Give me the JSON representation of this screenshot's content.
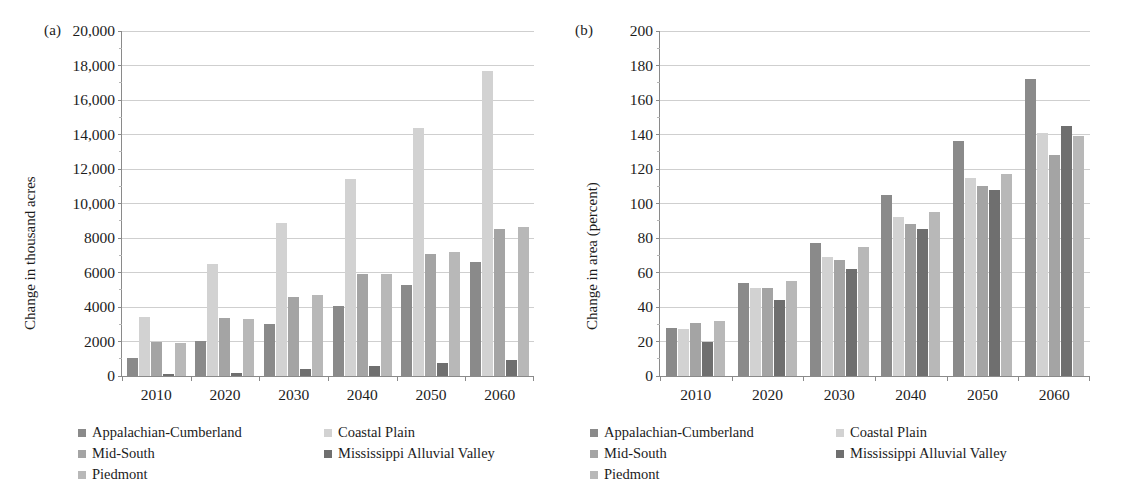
{
  "figure": {
    "panels": [
      {
        "tag": "(a)",
        "ylabel": "Change in thousand acres",
        "chart_data": {
          "type": "bar",
          "title": "",
          "xlabel": "",
          "ylabel": "Change in thousand acres",
          "categories": [
            "2010",
            "2020",
            "2030",
            "2040",
            "2050",
            "2060"
          ],
          "ylim": [
            0,
            20000
          ],
          "ytick_step": 2000,
          "yticks": [
            0,
            2000,
            4000,
            6000,
            8000,
            10000,
            12000,
            14000,
            16000,
            18000,
            20000
          ],
          "ytick_labels": [
            "0",
            "2000",
            "4000",
            "6000",
            "8000",
            "10,000",
            "12,000",
            "14,000",
            "16,000",
            "18,000",
            "20,000"
          ],
          "grid": true,
          "legend_position": "below",
          "series": [
            {
              "name": "Appalachian-Cumberland",
              "color": "#8a8a8a",
              "values": [
                1050,
                2050,
                3000,
                4050,
                5300,
                6600
              ]
            },
            {
              "name": "Coastal Plain",
              "color": "#d2d2d2",
              "values": [
                3450,
                6500,
                8850,
                11450,
                14400,
                17700
              ]
            },
            {
              "name": "Mid-South",
              "color": "#a4a4a4",
              "values": [
                2000,
                3350,
                4600,
                5900,
                7100,
                8500
              ]
            },
            {
              "name": "Mississippi Alluvial Valley",
              "color": "#6f6f6f",
              "values": [
                100,
                200,
                400,
                600,
                750,
                950
              ]
            },
            {
              "name": "Piedmont",
              "color": "#b8b8b8",
              "values": [
                1900,
                3300,
                4700,
                5900,
                7200,
                8650
              ]
            }
          ]
        }
      },
      {
        "tag": "(b)",
        "ylabel": "Change in area (percent)",
        "chart_data": {
          "type": "bar",
          "title": "",
          "xlabel": "",
          "ylabel": "Change in area (percent)",
          "categories": [
            "2010",
            "2020",
            "2030",
            "2040",
            "2050",
            "2060"
          ],
          "ylim": [
            0,
            200
          ],
          "ytick_step": 20,
          "yticks": [
            0,
            20,
            40,
            60,
            80,
            100,
            120,
            140,
            160,
            180,
            200
          ],
          "ytick_labels": [
            "0",
            "20",
            "40",
            "60",
            "80",
            "100",
            "120",
            "140",
            "160",
            "180",
            "200"
          ],
          "grid": true,
          "legend_position": "below",
          "series": [
            {
              "name": "Appalachian-Cumberland",
              "color": "#8a8a8a",
              "values": [
                28,
                54,
                77,
                105,
                136,
                172
              ]
            },
            {
              "name": "Coastal Plain",
              "color": "#d2d2d2",
              "values": [
                27,
                51,
                69,
                92,
                115,
                141
              ]
            },
            {
              "name": "Mid-South",
              "color": "#a4a4a4",
              "values": [
                31,
                51,
                67,
                88,
                110,
                128
              ]
            },
            {
              "name": "Mississippi Alluvial Valley",
              "color": "#6f6f6f",
              "values": [
                20,
                44,
                62,
                85,
                108,
                145
              ]
            },
            {
              "name": "Piedmont",
              "color": "#b8b8b8",
              "values": [
                32,
                55,
                75,
                95,
                117,
                139
              ]
            }
          ]
        }
      }
    ],
    "legend_entries": [
      {
        "label": "Appalachian-Cumberland",
        "color": "#8a8a8a"
      },
      {
        "label": "Coastal Plain",
        "color": "#d2d2d2"
      },
      {
        "label": "Mid-South",
        "color": "#a4a4a4"
      },
      {
        "label": "Mississippi Alluvial Valley",
        "color": "#6f6f6f"
      },
      {
        "label": "Piedmont",
        "color": "#b8b8b8"
      }
    ]
  }
}
